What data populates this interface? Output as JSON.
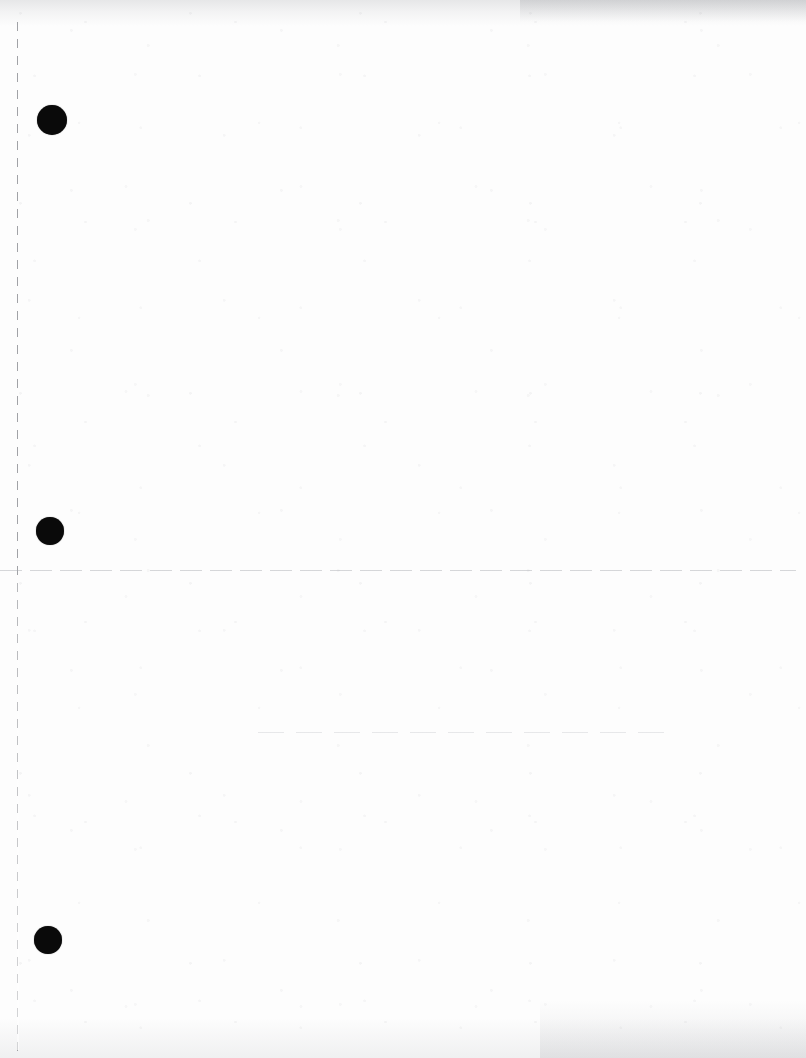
{
  "document": {
    "kind": "scanned-blank-page",
    "page_width": 806,
    "page_height": 1058,
    "background_color": "#fdfdfd",
    "ink_color": "#0a0a0a",
    "rule_color": "#76787e",
    "visible_text": "",
    "notes_label": ""
  },
  "margin_rule": {
    "orientation": "vertical",
    "x": 17,
    "y_start": 22,
    "y_end": 1052,
    "style": "dashed",
    "dash_length": 9,
    "gap_length": 8,
    "color": "#76787e"
  },
  "horizontal_rules": [
    {
      "id": "rule-primary",
      "x": 0,
      "y": 570,
      "width": 796,
      "style": "broken",
      "color": "#a8aab0"
    },
    {
      "id": "rule-secondary",
      "x": 258,
      "y": 732,
      "width": 414,
      "style": "broken",
      "color": "#bcbec4"
    }
  ],
  "punch_dots": [
    {
      "id": "punch-dot-top",
      "cx": 52,
      "cy": 120,
      "r": 15,
      "color": "#0a0a0a"
    },
    {
      "id": "punch-dot-middle",
      "cx": 50,
      "cy": 531,
      "r": 14,
      "color": "#0a0a0a"
    },
    {
      "id": "punch-dot-bottom",
      "cx": 48,
      "cy": 940,
      "r": 14,
      "color": "#0a0a0a"
    }
  ],
  "scan_artifacts": [
    {
      "id": "smudge-top",
      "edge": "top",
      "intensity": "medium"
    },
    {
      "id": "smudge-top-right",
      "edge": "top-right",
      "intensity": "medium"
    },
    {
      "id": "smudge-bottom",
      "edge": "bottom",
      "intensity": "light"
    },
    {
      "id": "smudge-bottom-right",
      "edge": "bottom-right",
      "intensity": "light"
    }
  ]
}
